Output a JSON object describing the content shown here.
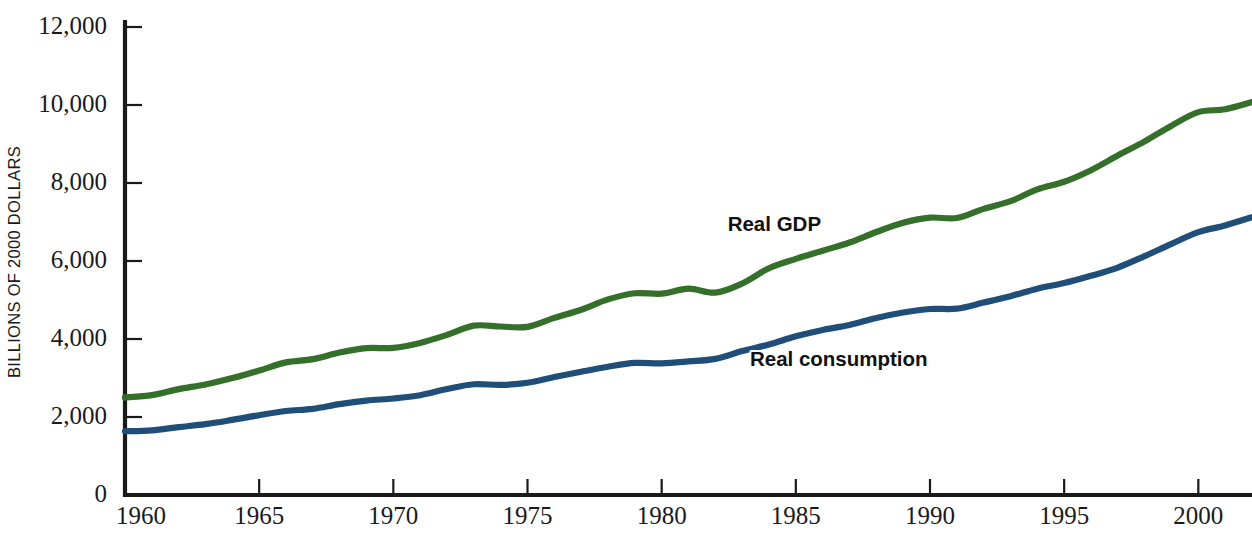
{
  "chart_data": {
    "type": "line",
    "title": "",
    "subtitle": "",
    "xlabel": "",
    "ylabel": "BILLIONS OF 2000 DOLLARS",
    "xlim": [
      1960,
      2002
    ],
    "ylim": [
      0,
      12000
    ],
    "grid": false,
    "legend_position": "inline-annotations",
    "x_ticks": [
      "1960",
      "1965",
      "1970",
      "1975",
      "1980",
      "1985",
      "1990",
      "1995",
      "2000"
    ],
    "x_tick_values": [
      1960,
      1965,
      1970,
      1975,
      1980,
      1985,
      1990,
      1995,
      2000
    ],
    "y_ticks": [
      "0",
      "2,000",
      "4,000",
      "6,000",
      "8,000",
      "10,000",
      "12,000"
    ],
    "y_tick_values": [
      0,
      2000,
      4000,
      6000,
      8000,
      10000,
      12000
    ],
    "x": [
      1960,
      1961,
      1962,
      1963,
      1964,
      1965,
      1966,
      1967,
      1968,
      1969,
      1970,
      1971,
      1972,
      1973,
      1974,
      1975,
      1976,
      1977,
      1978,
      1979,
      1980,
      1981,
      1982,
      1983,
      1984,
      1985,
      1986,
      1987,
      1988,
      1989,
      1990,
      1991,
      1992,
      1993,
      1994,
      1995,
      1996,
      1997,
      1998,
      1999,
      2000,
      2001,
      2002
    ],
    "series": [
      {
        "name": "Real GDP",
        "color": "#34702a",
        "label_x": 1984.2,
        "label_y": 6900,
        "values": [
          2502,
          2560,
          2715,
          2834,
          2999,
          3192,
          3400,
          3485,
          3653,
          3766,
          3772,
          3899,
          4105,
          4342,
          4320,
          4311,
          4541,
          4751,
          5015,
          5173,
          5162,
          5292,
          5189,
          5424,
          5814,
          6054,
          6264,
          6475,
          6743,
          6981,
          7113,
          7101,
          7337,
          7533,
          7836,
          8032,
          8329,
          8704,
          9067,
          9470,
          9817,
          9891,
          10075
        ]
      },
      {
        "name": "Real consumption",
        "color": "#1f4e79",
        "label_x": 1986.6,
        "label_y": 3450,
        "values": [
          1634,
          1658,
          1741,
          1817,
          1926,
          2046,
          2153,
          2210,
          2331,
          2421,
          2474,
          2559,
          2716,
          2840,
          2822,
          2877,
          3024,
          3161,
          3289,
          3387,
          3375,
          3424,
          3490,
          3690,
          3859,
          4068,
          4233,
          4360,
          4540,
          4680,
          4770,
          4778,
          4934,
          5099,
          5291,
          5434,
          5620,
          5832,
          6126,
          6439,
          6739,
          6910,
          7124
        ]
      }
    ],
    "annotations": [
      {
        "text": "Real GDP",
        "series": "Real GDP"
      },
      {
        "text": "Real consumption",
        "series": "Real consumption"
      }
    ]
  },
  "geometry": {
    "plot_left": 125,
    "plot_right": 1252,
    "plot_top": 27,
    "plot_bottom": 495,
    "axis_top": 20
  }
}
